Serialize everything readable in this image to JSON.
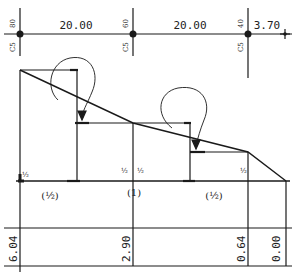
{
  "diagram": {
    "type": "moment-distribution-sketch",
    "spans": [
      {
        "label": "20.00"
      },
      {
        "label": "20.00"
      },
      {
        "label": "3.70"
      }
    ],
    "supports": [
      {
        "top": "80",
        "bottom": "C5"
      },
      {
        "top": "60",
        "bottom": "C5"
      },
      {
        "top": "40",
        "bottom": "C5"
      }
    ],
    "factors": [
      "(½)",
      "(1)",
      "(½)"
    ],
    "half_marks": [
      "½",
      "½",
      "½",
      "½"
    ],
    "values": [
      "6.04",
      "2.90",
      "0.64",
      "0.00"
    ],
    "colors": {
      "ink": "#1a1a1a",
      "background": "#ffffff"
    }
  }
}
